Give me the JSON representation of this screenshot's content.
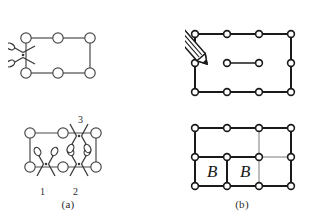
{
  "figure": {
    "background_color": "#ffffff",
    "line_color": "#3a3a3a",
    "line_color_dark": "#1a1a1a",
    "node_fill": "#ffffff",
    "text_color": "#2b2b2b"
  },
  "captions": {
    "panel_a": "(a)",
    "panel_b": "(b)"
  },
  "panels": {
    "a": {
      "label": "(a)",
      "top": {
        "name": "graph-with-single-cut",
        "nodes": [
          {
            "id": "n1",
            "x": 18,
            "y": 10
          },
          {
            "id": "n2",
            "x": 50,
            "y": 10
          },
          {
            "id": "n3",
            "x": 82,
            "y": 10
          },
          {
            "id": "n4",
            "x": 18,
            "y": 45
          },
          {
            "id": "n5",
            "x": 50,
            "y": 45
          },
          {
            "id": "n6",
            "x": 82,
            "y": 45
          }
        ],
        "edges": [
          {
            "from": "n1",
            "to": "n2"
          },
          {
            "from": "n2",
            "to": "n3"
          },
          {
            "from": "n3",
            "to": "n6"
          },
          {
            "from": "n4",
            "to": "n5"
          },
          {
            "from": "n5",
            "to": "n6"
          },
          {
            "from": "n1",
            "to": "n4"
          }
        ],
        "scissors": [
          {
            "id": "s1",
            "x": 18,
            "y": 27,
            "rotation": 0,
            "label": ""
          }
        ]
      },
      "bottom": {
        "name": "graph-with-three-cuts",
        "nodes": [
          {
            "id": "m1",
            "x": 14,
            "y": 12
          },
          {
            "id": "m2",
            "x": 47,
            "y": 12
          },
          {
            "id": "m3",
            "x": 80,
            "y": 12
          },
          {
            "id": "m4",
            "x": 14,
            "y": 48
          },
          {
            "id": "m5",
            "x": 47,
            "y": 48
          },
          {
            "id": "m6",
            "x": 80,
            "y": 48
          }
        ],
        "edges": [
          {
            "from": "m1",
            "to": "m2"
          },
          {
            "from": "m2",
            "to": "m3"
          },
          {
            "from": "m3",
            "to": "m6"
          },
          {
            "from": "m4",
            "to": "m5"
          },
          {
            "from": "m5",
            "to": "m6"
          },
          {
            "from": "m1",
            "to": "m4"
          }
        ],
        "scissors": [
          {
            "id": "sc1",
            "label": "1",
            "x": 30,
            "y": 48,
            "label_x": 27,
            "label_y": 72
          },
          {
            "id": "sc2",
            "label": "2",
            "x": 63,
            "y": 48,
            "label_x": 60,
            "label_y": 72
          },
          {
            "id": "sc3",
            "label": "3",
            "x": 63,
            "y": 12,
            "label_x": 66,
            "label_y": 2
          }
        ]
      }
    },
    "b": {
      "label": "(b)",
      "top": {
        "name": "graph-being-drawn-with-pencil",
        "nodes": [
          {
            "id": "p1",
            "x": 10,
            "y": 18
          },
          {
            "id": "p2",
            "x": 42,
            "y": 18
          },
          {
            "id": "p3",
            "x": 74,
            "y": 18
          },
          {
            "id": "p4",
            "x": 106,
            "y": 18
          },
          {
            "id": "p5",
            "x": 10,
            "y": 47
          },
          {
            "id": "p6",
            "x": 106,
            "y": 47
          },
          {
            "id": "p7",
            "x": 10,
            "y": 76
          },
          {
            "id": "p8",
            "x": 42,
            "y": 76
          },
          {
            "id": "p9",
            "x": 74,
            "y": 76
          },
          {
            "id": "p10",
            "x": 106,
            "y": 76
          },
          {
            "id": "pi1",
            "x": 42,
            "y": 47
          },
          {
            "id": "pi2",
            "x": 74,
            "y": 47
          }
        ],
        "edges": [
          {
            "from": "p1",
            "to": "p2"
          },
          {
            "from": "p2",
            "to": "p3"
          },
          {
            "from": "p3",
            "to": "p4"
          },
          {
            "from": "p1",
            "to": "p5"
          },
          {
            "from": "p5",
            "to": "p7"
          },
          {
            "from": "p4",
            "to": "p6"
          },
          {
            "from": "p6",
            "to": "p10"
          },
          {
            "from": "p7",
            "to": "p8"
          },
          {
            "from": "p8",
            "to": "p9"
          },
          {
            "from": "p9",
            "to": "p10"
          },
          {
            "from": "pi1",
            "to": "pi2"
          }
        ],
        "pencil": {
          "tip_x": 22,
          "tip_y": 50,
          "angle": -42,
          "length": 52
        }
      },
      "bottom": {
        "name": "partitioned-graph-with-blocks",
        "nodes": [
          {
            "id": "q1",
            "x": 10,
            "y": 10
          },
          {
            "id": "q2",
            "x": 42,
            "y": 10
          },
          {
            "id": "q3",
            "x": 74,
            "y": 10
          },
          {
            "id": "q4",
            "x": 106,
            "y": 10
          },
          {
            "id": "q5",
            "x": 10,
            "y": 39
          },
          {
            "id": "q6",
            "x": 42,
            "y": 39
          },
          {
            "id": "q7",
            "x": 74,
            "y": 39
          },
          {
            "id": "q8",
            "x": 106,
            "y": 39
          },
          {
            "id": "q9",
            "x": 10,
            "y": 68
          },
          {
            "id": "q10",
            "x": 42,
            "y": 68
          },
          {
            "id": "q11",
            "x": 74,
            "y": 68
          },
          {
            "id": "q12",
            "x": 106,
            "y": 68
          }
        ],
        "edges": [
          {
            "from": "q1",
            "to": "q2"
          },
          {
            "from": "q2",
            "to": "q3"
          },
          {
            "from": "q3",
            "to": "q4"
          },
          {
            "from": "q1",
            "to": "q5"
          },
          {
            "from": "q5",
            "to": "q9"
          },
          {
            "from": "q4",
            "to": "q8"
          },
          {
            "from": "q8",
            "to": "q12"
          },
          {
            "from": "q9",
            "to": "q10"
          },
          {
            "from": "q10",
            "to": "q11"
          },
          {
            "from": "q11",
            "to": "q12"
          },
          {
            "from": "q5",
            "to": "q6"
          },
          {
            "from": "q6",
            "to": "q7"
          },
          {
            "from": "q6",
            "to": "q10"
          }
        ],
        "light_edges": [
          {
            "from": "q3",
            "to": "q7"
          },
          {
            "from": "q7",
            "to": "q8"
          },
          {
            "from": "q7",
            "to": "q11"
          }
        ],
        "block_labels": [
          {
            "text": "B",
            "x": 26,
            "y": 55
          },
          {
            "text": "B",
            "x": 58,
            "y": 55
          }
        ]
      }
    }
  }
}
